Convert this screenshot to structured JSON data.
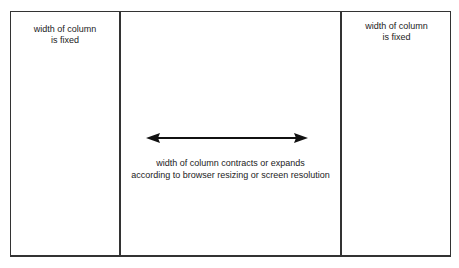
{
  "diagram": {
    "left_column": {
      "line1": "width of column",
      "line2": "is fixed"
    },
    "center_column": {
      "line1": "width of column contracts or expands",
      "line2": "according to browser resizing or screen resolution",
      "arrow": "double-headed-horizontal-arrow"
    },
    "right_column": {
      "line1": "width of column",
      "line2": "is fixed"
    },
    "colors": {
      "border": "#333333",
      "background": "#ffffff",
      "text": "#222222"
    }
  }
}
